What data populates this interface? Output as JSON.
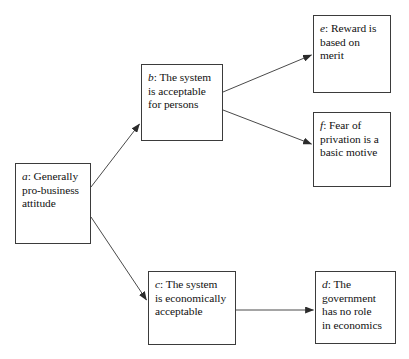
{
  "diagram": {
    "type": "flowchart",
    "background_color": "#ffffff",
    "line_color": "#3b3b3b",
    "text_color": "#111111",
    "nodes": [
      {
        "id": "a",
        "key": "a",
        "separator": ": ",
        "text": "Generally\npro-business\nattitude",
        "full_label": "a: Generally pro-business attitude"
      },
      {
        "id": "b",
        "key": "b",
        "separator": ": ",
        "text": "The system\nis acceptable\nfor persons",
        "full_label": "b: The system is acceptable for persons"
      },
      {
        "id": "c",
        "key": "c",
        "separator": ": ",
        "text": "The system\nis economically\nacceptable",
        "full_label": "c: The system is economically acceptable"
      },
      {
        "id": "d",
        "key": "d",
        "separator": ": ",
        "text": "The\ngovernment\nhas no role\nin economics",
        "full_label": "d: The government has no role in economics"
      },
      {
        "id": "e",
        "key": "e",
        "separator": ": ",
        "text": "Reward is\nbased on\nmerit",
        "full_label": "e: Reward is based on merit"
      },
      {
        "id": "f",
        "key": "f",
        "separator": ": ",
        "text": "Fear of\nprivation is a\nbasic motive",
        "full_label": "f: Fear of privation is a basic motive"
      }
    ],
    "edges": [
      {
        "id": "a-b",
        "from": "a",
        "to": "b",
        "arrowhead": "to",
        "label": ""
      },
      {
        "id": "a-c",
        "from": "a",
        "to": "c",
        "arrowhead": "to",
        "label": ""
      },
      {
        "id": "b-e",
        "from": "b",
        "to": "e",
        "arrowhead": "to",
        "label": ""
      },
      {
        "id": "b-f",
        "from": "b",
        "to": "f",
        "arrowhead": "to",
        "label": ""
      },
      {
        "id": "c-d",
        "from": "c",
        "to": "d",
        "arrowhead": "to",
        "label": ""
      }
    ]
  }
}
